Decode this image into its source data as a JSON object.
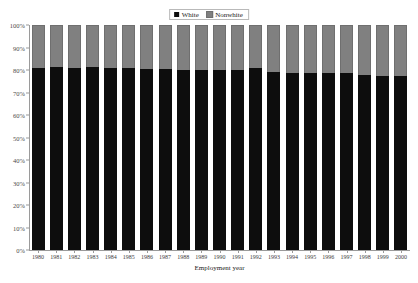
{
  "chart_data": {
    "type": "bar",
    "subtype": "stacked-100-percent",
    "title": "",
    "xlabel": "Employment year",
    "ylabel": "",
    "ylim": [
      0,
      100
    ],
    "yticks": [
      0,
      10,
      20,
      30,
      40,
      50,
      60,
      70,
      80,
      90,
      100
    ],
    "ytick_labels": [
      "0%",
      "10%",
      "20%",
      "30%",
      "40%",
      "50%",
      "60%",
      "70%",
      "80%",
      "90%",
      "100%"
    ],
    "grid": false,
    "legend_position": "top-center",
    "categories": [
      "1980",
      "1981",
      "1982",
      "1983",
      "1984",
      "1985",
      "1986",
      "1987",
      "1988",
      "1989",
      "1990",
      "1991",
      "1992",
      "1993",
      "1994",
      "1995",
      "1996",
      "1997",
      "1998",
      "1999",
      "2000"
    ],
    "series": [
      {
        "name": "White",
        "color": "#0d0d0d",
        "values": [
          81,
          81.5,
          81,
          81.5,
          81,
          81,
          80.5,
          80.5,
          80,
          80,
          80,
          80,
          81,
          79,
          78.5,
          78.5,
          78.5,
          78.5,
          78,
          77.5,
          77.5
        ]
      },
      {
        "name": "Nonwhite",
        "color": "#808080",
        "values": [
          19,
          18.5,
          19,
          18.5,
          19,
          19,
          19.5,
          19.5,
          20,
          20,
          20,
          20,
          19,
          21,
          21.5,
          21.5,
          21.5,
          21.5,
          22,
          22.5,
          22.5
        ]
      }
    ]
  },
  "legend": {
    "entries": [
      {
        "label": "White",
        "color": "#0d0d0d"
      },
      {
        "label": "Nonwhite",
        "color": "#808080"
      }
    ]
  },
  "axis": {
    "x_title": "Employment year"
  },
  "colors": {
    "white_series": "#0d0d0d",
    "nonwhite_series": "#808080",
    "axis": "#9a9a9a",
    "background": "#ffffff"
  }
}
